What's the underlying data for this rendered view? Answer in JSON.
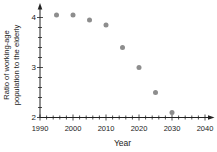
{
  "chart_data": {
    "type": "scatter",
    "title": "",
    "x": [
      1995,
      2000,
      2005,
      2010,
      2015,
      2020,
      2025,
      2030
    ],
    "values": [
      4.05,
      4.05,
      3.95,
      3.85,
      3.4,
      3.0,
      2.5,
      2.1
    ],
    "series_name": "Ratio of working-age population to the elderly",
    "xlabel": "Year",
    "ylabel": "Ratio of working-age population to the elderly",
    "ylabel_line1": "Ratio of working-age",
    "ylabel_line2": "population to the elderly",
    "xlim": [
      1990,
      2040
    ],
    "ylim": [
      2,
      4.2
    ],
    "x_ticks_major": [
      1990,
      2000,
      2010,
      2020,
      2030,
      2040
    ],
    "x_minor_step": 2,
    "y_ticks_major": [
      2,
      3,
      4
    ],
    "y_minor_step": 0.2,
    "grid": false,
    "legend": "none",
    "point_color": "#8d8d8d",
    "axis_color": "#222222",
    "background_color": "#ffffff",
    "axis_arrows": "top and right"
  }
}
